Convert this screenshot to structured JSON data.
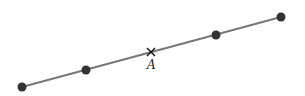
{
  "diagram": {
    "line": {
      "x1": 22,
      "y1": 87,
      "x2": 281,
      "y2": 17,
      "color": "#777777"
    },
    "points": [
      {
        "x": 22,
        "y": 87,
        "kind": "dot"
      },
      {
        "x": 86,
        "y": 70,
        "kind": "dot"
      },
      {
        "x": 151,
        "y": 52,
        "kind": "cross",
        "label": "A"
      },
      {
        "x": 216,
        "y": 35,
        "kind": "dot"
      },
      {
        "x": 281,
        "y": 17,
        "kind": "dot"
      }
    ],
    "dot_color": "#333333",
    "label_A": "A"
  }
}
